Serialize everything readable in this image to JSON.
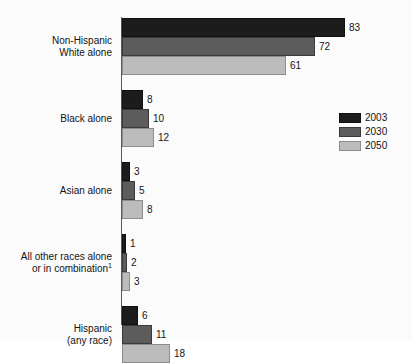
{
  "chart_data": {
    "type": "bar",
    "orientation": "horizontal",
    "title": "",
    "subtitle": "",
    "xlabel": "",
    "ylabel": "",
    "grid": false,
    "legend_position": "right",
    "xlim": [
      0,
      83
    ],
    "categories": [
      "Non-Hispanic\nWhite alone",
      "Black alone",
      "Asian alone",
      "All other races alone\nor in combination",
      "Hispanic\n(any race)"
    ],
    "category_footnotes": [
      "",
      "",
      "",
      "1",
      ""
    ],
    "series": [
      {
        "name": "2003",
        "color": "#1c1c1c",
        "values": [
          83,
          8,
          3,
          1,
          6
        ]
      },
      {
        "name": "2030",
        "color": "#5c5c5c",
        "values": [
          72,
          10,
          5,
          2,
          11
        ]
      },
      {
        "name": "2050",
        "color": "#bcbcbc",
        "values": [
          61,
          12,
          8,
          3,
          18
        ]
      }
    ],
    "data_labels": [
      [
        "83",
        "72",
        "61"
      ],
      [
        "8",
        "10",
        "12"
      ],
      [
        "3",
        "5",
        "8"
      ],
      [
        "1",
        "2",
        "3"
      ],
      [
        "6",
        "11",
        "18"
      ]
    ]
  },
  "legend": {
    "items": [
      {
        "label": "2003",
        "series_class": "s2003"
      },
      {
        "label": "2030",
        "series_class": "s2030"
      },
      {
        "label": "2050",
        "series_class": "s2050"
      }
    ]
  }
}
